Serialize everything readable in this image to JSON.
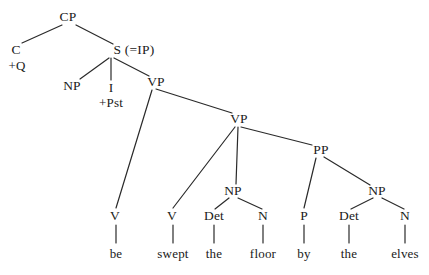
{
  "figure": {
    "type": "syntax-tree",
    "title": "",
    "sentence": "be swept the floor by the elves",
    "background_color": "#ffffff",
    "line_color": "#2a2a2a",
    "text_color": "#1a1a1a"
  },
  "nodes": {
    "cp": {
      "label": "CP",
      "x": 68,
      "y": 17
    },
    "c": {
      "label": "C",
      "x": 16,
      "y": 50
    },
    "c_feature": {
      "label": "+Q",
      "x": 17,
      "y": 66
    },
    "s": {
      "label": "S (=IP)",
      "x": 134,
      "y": 50
    },
    "np_subj": {
      "label": "NP",
      "x": 72,
      "y": 86
    },
    "infl": {
      "label": "I",
      "x": 111,
      "y": 88
    },
    "infl_feat": {
      "label": "+Pst",
      "x": 111,
      "y": 103
    },
    "vp_upper": {
      "label": "VP",
      "x": 156,
      "y": 82
    },
    "vp_lower": {
      "label": "VP",
      "x": 239,
      "y": 119
    },
    "pp": {
      "label": "PP",
      "x": 321,
      "y": 150
    },
    "np_obj": {
      "label": "NP",
      "x": 233,
      "y": 191
    },
    "np_pobj": {
      "label": "NP",
      "x": 377,
      "y": 191
    },
    "v_aux": {
      "label": "V",
      "x": 115,
      "y": 216
    },
    "v_main": {
      "label": "V",
      "x": 172,
      "y": 216
    },
    "det_obj": {
      "label": "Det",
      "x": 214,
      "y": 216
    },
    "n_obj": {
      "label": "N",
      "x": 263,
      "y": 216
    },
    "p": {
      "label": "P",
      "x": 304,
      "y": 216
    },
    "det_pobj": {
      "label": "Det",
      "x": 349,
      "y": 216
    },
    "n_pobj": {
      "label": "N",
      "x": 405,
      "y": 216
    }
  },
  "words": {
    "be": {
      "label": "be",
      "x": 116,
      "y": 254
    },
    "swept": {
      "label": "swept",
      "x": 173,
      "y": 254
    },
    "the1": {
      "label": "the",
      "x": 214,
      "y": 254
    },
    "floor": {
      "label": "floor",
      "x": 263,
      "y": 254
    },
    "by": {
      "label": "by",
      "x": 304,
      "y": 254
    },
    "the2": {
      "label": "the",
      "x": 349,
      "y": 254
    },
    "elves": {
      "label": "elves",
      "x": 405,
      "y": 254
    }
  },
  "edges": [
    {
      "name": "cp-to-c",
      "x1": 62,
      "y1": 25,
      "x2": 22,
      "y2": 43
    },
    {
      "name": "cp-to-s",
      "x1": 76,
      "y1": 25,
      "x2": 113,
      "y2": 44
    },
    {
      "name": "s-to-np-subject",
      "x1": 109,
      "y1": 58,
      "x2": 80,
      "y2": 79
    },
    {
      "name": "s-to-i",
      "x1": 111,
      "y1": 58,
      "x2": 111,
      "y2": 80
    },
    {
      "name": "s-to-vp-upper",
      "x1": 114,
      "y1": 58,
      "x2": 149,
      "y2": 76
    },
    {
      "name": "vp-upper-to-v-aux",
      "x1": 152,
      "y1": 90,
      "x2": 116,
      "y2": 208
    },
    {
      "name": "vp-upper-to-vp-lower",
      "x1": 156,
      "y1": 89,
      "x2": 232,
      "y2": 113
    },
    {
      "name": "vp-lower-to-v-main",
      "x1": 235,
      "y1": 127,
      "x2": 173,
      "y2": 208
    },
    {
      "name": "vp-lower-to-np-obj",
      "x1": 238,
      "y1": 127,
      "x2": 236,
      "y2": 184
    },
    {
      "name": "vp-lower-to-pp",
      "x1": 241,
      "y1": 127,
      "x2": 312,
      "y2": 145
    },
    {
      "name": "np-obj-to-det",
      "x1": 229,
      "y1": 198,
      "x2": 215,
      "y2": 209
    },
    {
      "name": "np-obj-to-n",
      "x1": 238,
      "y1": 198,
      "x2": 262,
      "y2": 209
    },
    {
      "name": "pp-to-p",
      "x1": 316,
      "y1": 158,
      "x2": 304,
      "y2": 208
    },
    {
      "name": "pp-to-np-pobj",
      "x1": 324,
      "y1": 157,
      "x2": 370,
      "y2": 185
    },
    {
      "name": "np-pobj-to-det",
      "x1": 373,
      "y1": 198,
      "x2": 351,
      "y2": 209
    },
    {
      "name": "np-pobj-to-n",
      "x1": 382,
      "y1": 198,
      "x2": 404,
      "y2": 209
    }
  ],
  "terminal_stems": [
    {
      "name": "stem-v-aux",
      "x": 116,
      "y1": 225,
      "y2": 243
    },
    {
      "name": "stem-v-main",
      "x": 173,
      "y1": 225,
      "y2": 243
    },
    {
      "name": "stem-det-obj",
      "x": 214,
      "y1": 225,
      "y2": 243
    },
    {
      "name": "stem-n-obj",
      "x": 263,
      "y1": 225,
      "y2": 243
    },
    {
      "name": "stem-p",
      "x": 304,
      "y1": 225,
      "y2": 243
    },
    {
      "name": "stem-det-pobj",
      "x": 349,
      "y1": 225,
      "y2": 243
    },
    {
      "name": "stem-n-pobj",
      "x": 405,
      "y1": 225,
      "y2": 243
    }
  ]
}
